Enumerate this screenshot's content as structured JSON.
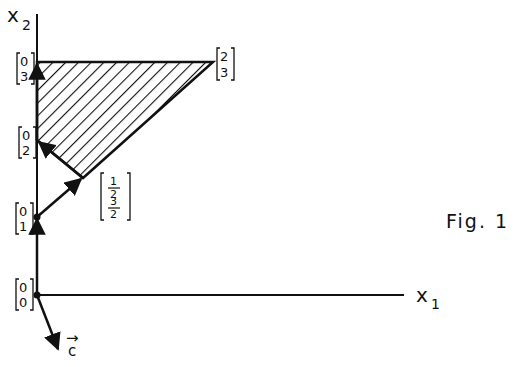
{
  "figure": {
    "caption": "Fig. 1",
    "axes": {
      "x_label": "x",
      "x_sub": "1",
      "y_label": "x",
      "y_sub": "2"
    },
    "points": [
      {
        "name": "origin",
        "top": "0",
        "bottom": "0",
        "coords": [
          0,
          0
        ]
      },
      {
        "name": "p01",
        "top": "0",
        "bottom": "1",
        "coords": [
          0,
          1
        ]
      },
      {
        "name": "p02",
        "top": "0",
        "bottom": "2",
        "coords": [
          0,
          2
        ]
      },
      {
        "name": "p03",
        "top": "0",
        "bottom": "3",
        "coords": [
          0,
          3
        ]
      },
      {
        "name": "p23",
        "top": "2",
        "bottom": "3",
        "coords": [
          2,
          3
        ]
      },
      {
        "name": "phalf",
        "top": "1/2",
        "bottom": "3/2",
        "coords": [
          0.5,
          1.5
        ]
      }
    ],
    "fractions": {
      "half_num": "1",
      "half_den": "2",
      "threehalf_num": "3",
      "threehalf_den": "2"
    },
    "vector": {
      "label": "c",
      "arrow": "→"
    },
    "feasible_region": {
      "vertices": [
        [
          0,
          2
        ],
        [
          0.5,
          1.5
        ],
        [
          2,
          3
        ],
        [
          0,
          3
        ]
      ],
      "fill": "hatched"
    },
    "path": [
      [
        0,
        0
      ],
      [
        0,
        1
      ],
      [
        0.5,
        1.5
      ],
      [
        0,
        2
      ],
      [
        0,
        3
      ]
    ]
  }
}
